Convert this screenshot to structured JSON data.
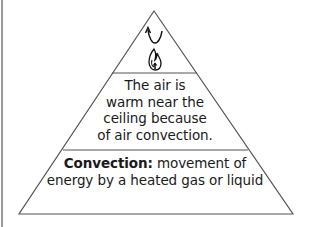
{
  "diagram": {
    "type": "pyramid",
    "tiers": [
      {
        "position": "top",
        "icon": "flame-with-rising-arrow-icon",
        "text": ""
      },
      {
        "position": "middle",
        "lines": [
          "The air is",
          "warm near the",
          "ceiling because",
          "of air convection."
        ]
      },
      {
        "position": "bottom",
        "term": "Convection:",
        "definition_first_line": " movement of",
        "definition_second_line": "energy by a heated gas or liquid"
      }
    ],
    "colors": {
      "stroke": "#555555",
      "text": "#1a1a1a",
      "background": "#ffffff"
    }
  }
}
